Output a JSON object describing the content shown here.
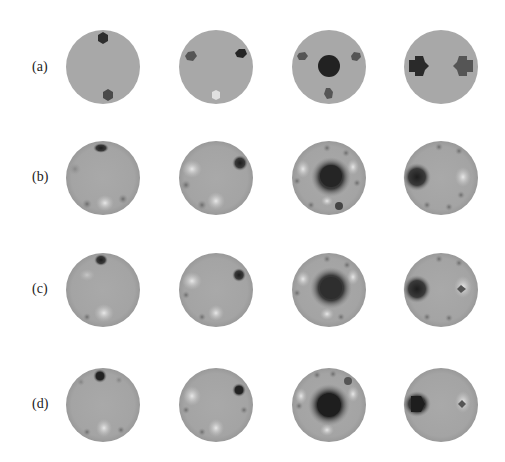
{
  "figure": {
    "rows": [
      {
        "label": "(a)",
        "y": 67,
        "name": "true-conductivity"
      },
      {
        "label": "(b)",
        "y": 178,
        "name": "reconstruction-b"
      },
      {
        "label": "(c)",
        "y": 290,
        "name": "reconstruction-c"
      },
      {
        "label": "(d)",
        "y": 405,
        "name": "reconstruction-d"
      }
    ],
    "columns_x": [
      103,
      216,
      329,
      441
    ],
    "colors": {
      "background_disc": "#a8a8a8",
      "dark_inclusion": "#2a2a2a",
      "mid_inclusion": "#555555",
      "light_inclusion": "#d8d8d8",
      "page": "#ffffff"
    }
  }
}
